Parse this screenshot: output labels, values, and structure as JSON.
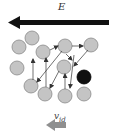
{
  "diagram": {
    "field_label": "E",
    "velocity_label_main": "v",
    "velocity_label_sub": "id",
    "colors": {
      "field_arrow": "#111111",
      "particle_fill": "#c4c4c4",
      "particle_stroke": "#8a8a8a",
      "highlight_particle": "#111111",
      "path_arrows": "#333333",
      "velocity_arrow": "#8f8f8f"
    },
    "particles": [
      {
        "x": 32,
        "y": 38,
        "type": "normal"
      },
      {
        "x": 19,
        "y": 47,
        "type": "normal"
      },
      {
        "x": 43,
        "y": 52,
        "type": "normal"
      },
      {
        "x": 65,
        "y": 46,
        "type": "normal"
      },
      {
        "x": 91,
        "y": 45,
        "type": "normal"
      },
      {
        "x": 17,
        "y": 68,
        "type": "normal"
      },
      {
        "x": 64,
        "y": 67,
        "type": "normal"
      },
      {
        "x": 31,
        "y": 86,
        "type": "normal"
      },
      {
        "x": 45,
        "y": 94,
        "type": "normal"
      },
      {
        "x": 65,
        "y": 96,
        "type": "normal"
      },
      {
        "x": 84,
        "y": 77,
        "type": "highlighted"
      },
      {
        "x": 84,
        "y": 94,
        "type": "normal"
      }
    ]
  }
}
